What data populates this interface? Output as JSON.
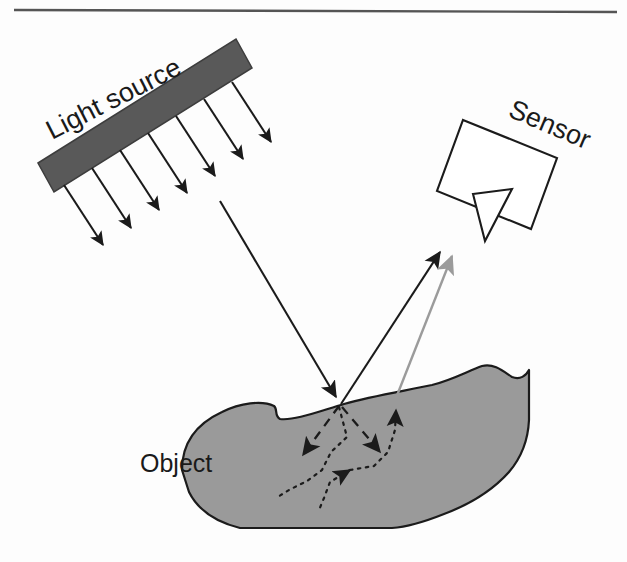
{
  "figure": {
    "width": 627,
    "height": 562,
    "background_color": "#fdfdfd",
    "top_rule": {
      "name": "horizontal-rule",
      "color": "#555555",
      "x1": 14,
      "y1": 9,
      "x2": 617,
      "y2": 12
    }
  },
  "labels": {
    "light_source": "Light source",
    "sensor": "Sensor",
    "object": "Object"
  },
  "colors": {
    "light_source_fill": "#595959",
    "object_fill": "#9a9a9a",
    "outline": "#1b1b1b",
    "subsurface_exit_ray": "#9b9b9b",
    "page_background": "#fdfdfd",
    "rule": "#555555"
  },
  "elements": {
    "light_source_bar": {
      "name": "light-source-bar",
      "rotation_deg": -27,
      "points": "38,163 236,39 252,68 54,192"
    },
    "sensor_body": {
      "name": "sensor-body",
      "rotation_deg": 22,
      "points": "463,120 557,158 531,229 437,191"
    },
    "sensor_stand": {
      "name": "sensor-stand",
      "points": "473,195 511,190 483,240"
    },
    "object_outline": {
      "name": "object-silhouette",
      "points": "182,468 190,441 200,424 219,410 245,402 267,402 278,409 272,418 285,420 318,411 343,403 372,397 408,390 432,385 452,377 468,369 480,366 496,370 505,377 519,376 527,371 529,378 527,418 523,441 514,457 498,474 479,489 463,500 450,508 430,516 412,523 396,527 237,527 213,519 196,504 185,487"
    }
  },
  "illumination_arrows": {
    "name": "illumination-ray-group",
    "count": 7,
    "direction_deg": 57,
    "color": "#1b1b1b",
    "rays": [
      {
        "x1": 64,
        "y1": 185,
        "x2": 105,
        "y2": 248
      },
      {
        "x1": 92,
        "y1": 168,
        "x2": 133,
        "y2": 231
      },
      {
        "x1": 120,
        "y1": 150,
        "x2": 161,
        "y2": 213
      },
      {
        "x1": 148,
        "y1": 133,
        "x2": 189,
        "y2": 196
      },
      {
        "x1": 176,
        "y1": 116,
        "x2": 217,
        "y2": 179
      },
      {
        "x1": 204,
        "y1": 99,
        "x2": 245,
        "y2": 162
      },
      {
        "x1": 232,
        "y1": 82,
        "x2": 273,
        "y2": 145
      }
    ]
  },
  "main_rays": {
    "incident": {
      "name": "incident-ray",
      "label": "incoming light ray",
      "x1": 220,
      "y1": 201,
      "x2": 339,
      "y2": 402,
      "color": "#1b1b1b"
    },
    "specular_reflection": {
      "name": "specular-reflected-ray",
      "label": "surface reflection toward sensor",
      "x1": 341,
      "y1": 404,
      "x2": 442,
      "y2": 249,
      "color": "#1b1b1b"
    },
    "subsurface_exit": {
      "name": "subsurface-exit-ray",
      "label": "diffuse subsurface exit ray toward sensor",
      "x1": 396,
      "y1": 398,
      "x2": 453,
      "y2": 253,
      "color": "#9b9b9b"
    }
  },
  "subsurface_paths": {
    "name": "subsurface-scattering-paths",
    "entry_point": {
      "x": 340,
      "y": 404
    },
    "dashed_branches": [
      {
        "name": "dashed-branch-left",
        "points": "340,404 305,453",
        "head_at": {
          "x": 300,
          "y": 460,
          "angle_deg": 125
        }
      },
      {
        "name": "dashed-branch-right",
        "points": "341,405 379,450",
        "head_at": {
          "x": 385,
          "y": 457,
          "angle_deg": 50
        }
      }
    ],
    "dotted_walk_left": {
      "name": "dotted-path-left",
      "points": "339,406 346,436 331,453 323,470 309,481 291,490 277,497"
    },
    "dotted_walk_center": {
      "name": "dotted-path-center",
      "points": "344,472 329,483 323,498 318,509",
      "head_at": {
        "x": 348,
        "y": 470,
        "angle_deg": 192
      }
    },
    "dotted_walk_exit": {
      "name": "dotted-path-exit",
      "points": "348,470 372,466 387,452 394,430 396,408",
      "head_at": {
        "x": 396,
        "y": 400,
        "angle_deg": 272
      }
    }
  },
  "legend_semantics": {
    "black_arrow": "direct / specularly reflected light",
    "gray_arrow": "light exiting after subsurface scattering",
    "dashed_line": "refracted light entering the material",
    "dotted_line": "random-walk scattering inside the material"
  }
}
